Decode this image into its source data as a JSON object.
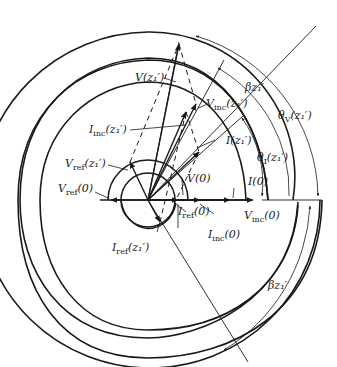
{
  "diagram": {
    "type": "phasor-spiral",
    "center": [
      148,
      200
    ],
    "colors": {
      "stroke": "#1a1a1a",
      "background": "#ffffff"
    },
    "labels": {
      "V_z1": "V(z₁′)",
      "V_inc_z1": "V",
      "V_inc_z1_sub": "inc",
      "V_inc_z1_arg": "(z₁′)",
      "I_inc_z1": "I",
      "I_inc_z1_sub": "inc",
      "I_inc_z1_arg": "(z₁′)",
      "I_z1": "I(z₁′)",
      "V_ref_z1": "V",
      "V_ref_z1_sub": "ref",
      "V_ref_z1_arg": "(z₁′)",
      "V_ref_0": "V",
      "V_ref_0_sub": "ref",
      "V_ref_0_arg": "(0)",
      "V_0": "V(0)",
      "I_0": "I(0)",
      "I_ref_0": "I",
      "I_ref_0_sub": "ref",
      "I_ref_0_arg": "(0)",
      "V_inc_0": "V",
      "V_inc_0_sub": "inc",
      "V_inc_0_arg": "(0)",
      "I_inc_0": "I",
      "I_inc_0_sub": "inc",
      "I_inc_0_arg": "(0)",
      "I_ref_z1": "I",
      "I_ref_z1_sub": "ref",
      "I_ref_z1_arg": "(z₁′)",
      "beta_z1_top": "βz₁′",
      "theta_V": "θ",
      "theta_V_sub": "V",
      "theta_V_arg": "(z₁′)",
      "theta_I": "θ",
      "theta_I_sub": "I",
      "theta_I_arg": "(z₁′)",
      "beta_z1_bottom": "βz₁′"
    }
  }
}
